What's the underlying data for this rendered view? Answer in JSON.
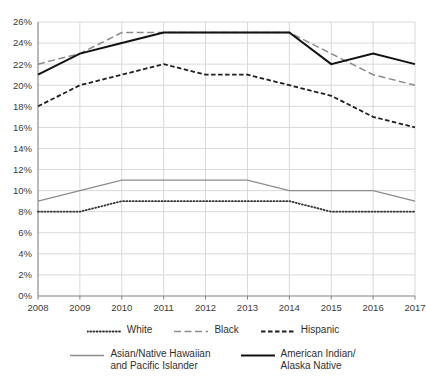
{
  "chart_data": {
    "type": "line",
    "title": "",
    "subtitle": "",
    "xlabel": "",
    "ylabel": "",
    "x": [
      2008,
      2009,
      2010,
      2011,
      2012,
      2013,
      2014,
      2015,
      2016,
      2017
    ],
    "categories": [
      "2008",
      "2009",
      "2010",
      "2011",
      "2012",
      "2013",
      "2014",
      "2015",
      "2016",
      "2017"
    ],
    "ylim": [
      0,
      26
    ],
    "ytick_values": [
      0,
      2,
      4,
      6,
      8,
      10,
      12,
      14,
      16,
      18,
      20,
      22,
      24,
      26
    ],
    "ytick_labels": [
      "0%",
      "2%",
      "4%",
      "6%",
      "8%",
      "10%",
      "12%",
      "14%",
      "16%",
      "18%",
      "20%",
      "22%",
      "24%",
      "26%"
    ],
    "grid": true,
    "grid_color": "#d9d9d9",
    "axis_color": "#808080",
    "background": "#ffffff",
    "legend_position": "bottom",
    "series": [
      {
        "name": "White",
        "values": [
          8,
          8,
          9,
          9,
          9,
          9,
          9,
          8,
          8,
          8
        ],
        "color": "#333333",
        "style": "dotted",
        "dasharray": "1,2.2",
        "width": 1.8
      },
      {
        "name": "Black",
        "values": [
          22,
          23,
          25,
          25,
          25,
          25,
          25,
          23,
          21,
          20
        ],
        "color": "#8c8c8c",
        "style": "long-dash",
        "dasharray": "7,3.5",
        "width": 1.5
      },
      {
        "name": "Hispanic",
        "values": [
          18,
          20,
          21,
          22,
          21,
          21,
          20,
          19,
          17,
          16
        ],
        "color": "#1f1f1f",
        "style": "dashed",
        "dasharray": "4.5,2.5",
        "width": 1.8
      },
      {
        "name": "Asian/Native Hawaiian\nand Pacific Islander",
        "values": [
          9,
          10,
          11,
          11,
          11,
          11,
          10,
          10,
          10,
          9
        ],
        "color": "#8c8c8c",
        "style": "solid",
        "dasharray": "",
        "width": 1.3
      },
      {
        "name": "American Indian/\nAlaska Native",
        "values": [
          21,
          23,
          24,
          25,
          25,
          25,
          25,
          22,
          23,
          22
        ],
        "color": "#111111",
        "style": "solid",
        "dasharray": "",
        "width": 2.0
      }
    ]
  },
  "legend": {
    "row1": [
      {
        "label": "White",
        "series_index": 0
      },
      {
        "label": "Black",
        "series_index": 1
      },
      {
        "label": "Hispanic",
        "series_index": 2
      }
    ],
    "row2": [
      {
        "label": "Asian/Native Hawaiian\nand Pacific Islander",
        "series_index": 3
      },
      {
        "label": "American Indian/\nAlaska Native",
        "series_index": 4
      }
    ]
  }
}
